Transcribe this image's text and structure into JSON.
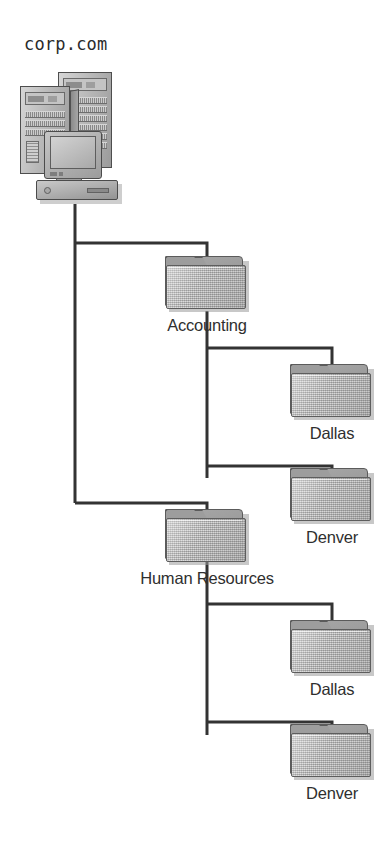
{
  "diagram": {
    "title": "corp.com",
    "type": "organizational-unit-tree",
    "root": {
      "name": "corp.com",
      "icon": "server-icon"
    },
    "nodes": [
      {
        "id": "accounting",
        "label": "Accounting",
        "icon": "folder-icon",
        "level": 1,
        "parent": "corp.com"
      },
      {
        "id": "acct-dallas",
        "label": "Dallas",
        "icon": "folder-icon",
        "level": 2,
        "parent": "accounting"
      },
      {
        "id": "acct-denver",
        "label": "Denver",
        "icon": "folder-icon",
        "level": 2,
        "parent": "accounting"
      },
      {
        "id": "hr",
        "label": "Human Resources",
        "icon": "folder-icon",
        "level": 1,
        "parent": "corp.com"
      },
      {
        "id": "hr-dallas",
        "label": "Dallas",
        "icon": "folder-icon",
        "level": 2,
        "parent": "hr"
      },
      {
        "id": "hr-denver",
        "label": "Denver",
        "icon": "folder-icon",
        "level": 2,
        "parent": "hr"
      }
    ]
  },
  "colors": {
    "background": "#ffffff",
    "line": "#333333",
    "folder_front": "#b9b9b9",
    "folder_back": "#9d9d9d",
    "text": "#2f2f2f"
  }
}
